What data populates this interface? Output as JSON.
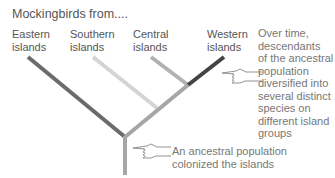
{
  "title": "Mockingbirds from....",
  "groups": [
    {
      "line1": "Eastern",
      "line2": "islands",
      "color": "#6b6b6b"
    },
    {
      "line1": "Southern",
      "line2": "islands",
      "color": "#d4d4d4"
    },
    {
      "line1": "Central",
      "line2": "islands",
      "color": "#b2b2b2"
    },
    {
      "line1": "Western",
      "line2": "islands",
      "color": "#444444"
    }
  ],
  "trunk_color": "#a6a6a6",
  "notes": {
    "diversified": [
      "Over time,",
      "descendants",
      "of the ancestral",
      "population",
      "diversified into",
      "several distinct",
      "species on",
      "different island",
      "groups"
    ],
    "ancestral": [
      "An ancestral population",
      "colonized the islands"
    ]
  },
  "icons": [
    "pointing-hand-icon",
    "pointing-hand-icon"
  ]
}
